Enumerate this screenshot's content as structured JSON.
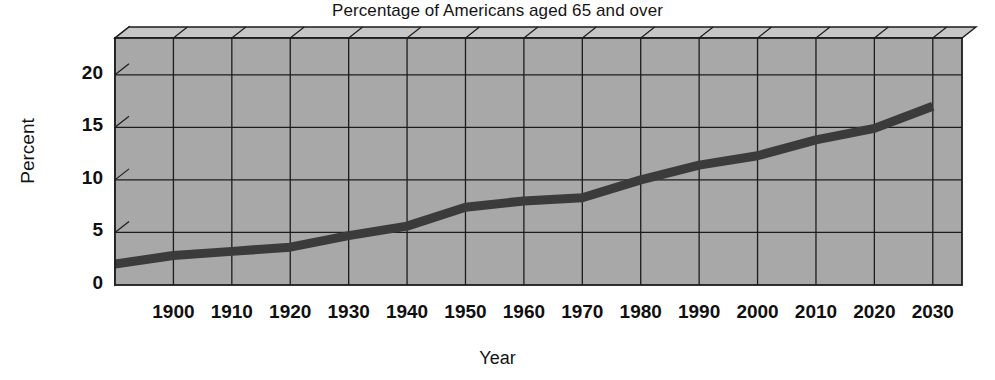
{
  "chart_data": {
    "type": "line",
    "title": "Percentage of Americans aged 65 and over",
    "xlabel": "Year",
    "ylabel": "Percent",
    "xlim": [
      1890,
      2035
    ],
    "ylim": [
      0,
      23.5
    ],
    "grid": true,
    "legend": "none",
    "style": "3d-box-gray",
    "xticks": [
      "1900",
      "1910",
      "1920",
      "1930",
      "1940",
      "1950",
      "1960",
      "1970",
      "1980",
      "1990",
      "2000",
      "2010",
      "2020",
      "2030"
    ],
    "yticks": [
      "0",
      "5",
      "10",
      "15",
      "20"
    ],
    "x": [
      1890,
      1900,
      1910,
      1920,
      1930,
      1940,
      1950,
      1960,
      1970,
      1980,
      1990,
      2000,
      2010,
      2020,
      2030
    ],
    "values": [
      2.0,
      2.8,
      3.2,
      3.6,
      4.7,
      5.6,
      7.4,
      8.0,
      8.3,
      10.0,
      11.4,
      12.3,
      13.8,
      14.9,
      17.0
    ],
    "series": [
      {
        "name": "Percent aged 65 and over",
        "color": "#3b3b3b",
        "values": [
          2.0,
          2.8,
          3.2,
          3.6,
          4.7,
          5.6,
          7.4,
          8.0,
          8.3,
          10.0,
          11.4,
          12.3,
          13.8,
          14.9,
          17.0
        ]
      }
    ],
    "colors": {
      "plot_fill": "#a8a8a8",
      "top_face": "#c6c6c6",
      "side_face": "#d2d2d2",
      "gridline": "#1c1c1c",
      "line": "#3b3b3b",
      "text": "#101010",
      "background": "#ffffff"
    }
  }
}
